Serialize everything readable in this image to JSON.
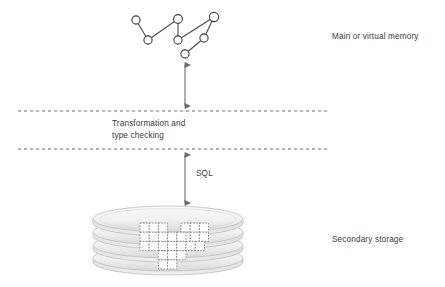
{
  "diagram": {
    "labels": {
      "main_memory": "Main or virtual memory",
      "secondary_storage": "Secondary storage",
      "transformation": "Transformation and\ntype checking",
      "sql": "SQL"
    },
    "colors": {
      "text": "#3b3b3b",
      "stroke": "#555555",
      "dashed_line": "#6e6e6e",
      "disk_fill_light": "#f4f4f4",
      "disk_fill_dark": "#dedede",
      "block_stroke": "#888888",
      "background": "#ffffff"
    },
    "layers": [
      {
        "name": "main-or-virtual-memory",
        "label": "Main or virtual memory"
      },
      {
        "name": "transformation-and-type-checking",
        "label": "Transformation and type checking"
      },
      {
        "name": "secondary-storage",
        "label": "Secondary storage"
      }
    ],
    "graph": {
      "node_radius": 4.1,
      "nodes": [
        {
          "id": "n1",
          "x": 136,
          "y": 20
        },
        {
          "id": "n2",
          "x": 148,
          "y": 40
        },
        {
          "id": "n3",
          "x": 178,
          "y": 19
        },
        {
          "id": "n4",
          "x": 178,
          "y": 40
        },
        {
          "id": "n5",
          "x": 214,
          "y": 17
        },
        {
          "id": "n6",
          "x": 204,
          "y": 38
        },
        {
          "id": "n7",
          "x": 185,
          "y": 54
        }
      ],
      "edges": [
        [
          "n1",
          "n2"
        ],
        [
          "n2",
          "n3"
        ],
        [
          "n3",
          "n4"
        ],
        [
          "n4",
          "n5"
        ],
        [
          "n5",
          "n6"
        ],
        [
          "n6",
          "n7"
        ]
      ]
    },
    "dashed_lines": [
      {
        "name": "upper-boundary",
        "y": 111,
        "x1": 18,
        "x2": 330
      },
      {
        "name": "lower-boundary",
        "y": 149,
        "x1": 18,
        "x2": 330
      }
    ],
    "arrows": [
      {
        "name": "memory-transformation-arrow",
        "x": 185,
        "y1": 62,
        "y2": 110,
        "double_headed": true
      },
      {
        "name": "sql-arrow",
        "x": 185,
        "y1": 152,
        "y2": 206,
        "double_headed": true
      }
    ],
    "disk_stack": {
      "platters": 4,
      "center_x": 168,
      "radius_x": 75,
      "radius_y": 13,
      "top_y": 219,
      "spacing": 13
    },
    "data_blocks": {
      "cell": 9.2,
      "cells": [
        [
          140,
          224
        ],
        [
          149.2,
          224
        ],
        [
          158.4,
          224
        ],
        [
          140,
          233.2
        ],
        [
          149.2,
          233.2
        ],
        [
          158.4,
          233.2
        ],
        [
          182,
          224
        ],
        [
          191.2,
          224
        ],
        [
          200.4,
          224
        ],
        [
          182,
          233.2
        ],
        [
          191.2,
          233.2
        ],
        [
          200.4,
          233.2
        ],
        [
          163,
          233.2
        ],
        [
          172.2,
          233.2
        ],
        [
          163,
          242.4
        ],
        [
          172.2,
          242.4
        ],
        [
          181.4,
          242.4
        ],
        [
          190.6,
          242.4
        ],
        [
          140,
          242.4
        ],
        [
          149.2,
          242.4
        ],
        [
          158.4,
          242.4
        ],
        [
          158.4,
          251.6
        ],
        [
          167.6,
          251.6
        ],
        [
          176.8,
          251.6
        ],
        [
          158.4,
          260.8
        ],
        [
          167.6,
          260.8
        ]
      ]
    }
  }
}
